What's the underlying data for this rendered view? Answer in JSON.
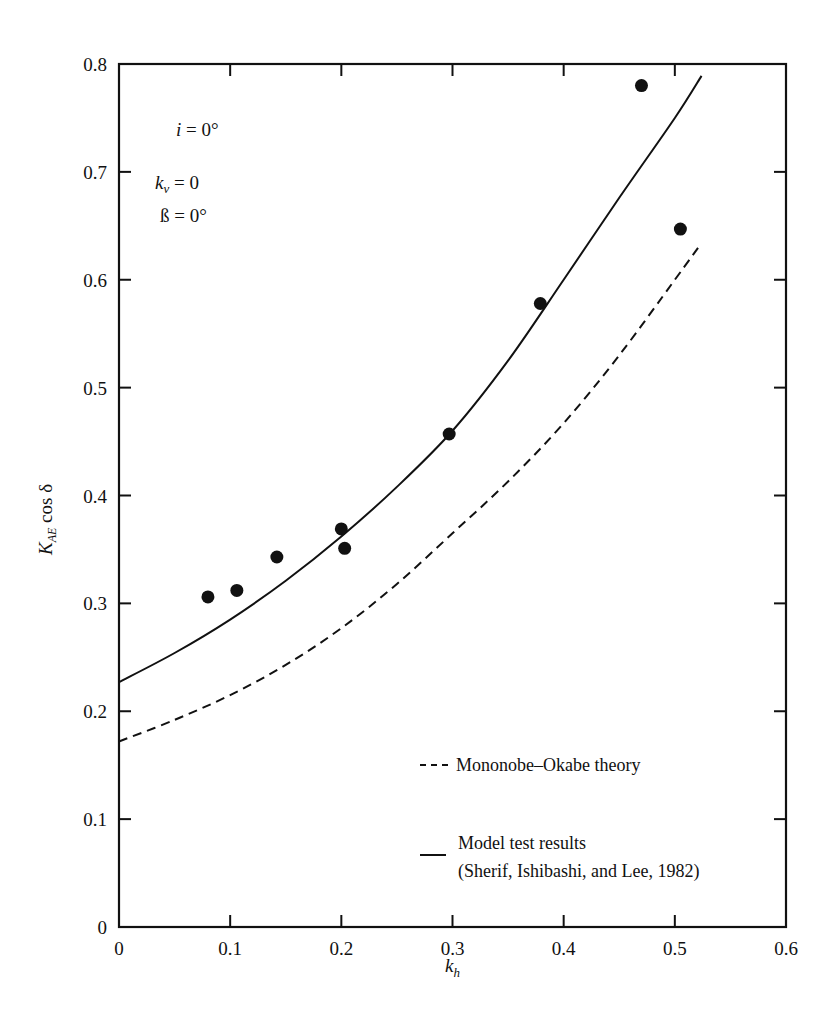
{
  "chart_data": {
    "type": "scatter",
    "title": "",
    "xlabel": "k_h",
    "ylabel": "K_AE cos δ",
    "xlim": [
      0,
      0.6
    ],
    "ylim": [
      0,
      0.8
    ],
    "x_ticks": [
      "0",
      "0.1",
      "0.2",
      "0.3",
      "0.4",
      "0.5",
      "0.6"
    ],
    "y_ticks": [
      "0",
      "0.1",
      "0.2",
      "0.3",
      "0.4",
      "0.5",
      "0.6",
      "0.7",
      "0.8"
    ],
    "grid": false,
    "legend_position": "lower right",
    "annotations": [
      "i = 0°",
      "k_v = 0",
      "β = 0°"
    ],
    "series": [
      {
        "name": "Data points",
        "style": "filled-circle",
        "points": [
          [
            0.08,
            0.306
          ],
          [
            0.106,
            0.312
          ],
          [
            0.142,
            0.343
          ],
          [
            0.2,
            0.369
          ],
          [
            0.203,
            0.351
          ],
          [
            0.297,
            0.457
          ],
          [
            0.379,
            0.578
          ],
          [
            0.47,
            0.78
          ],
          [
            0.505,
            0.647
          ]
        ]
      },
      {
        "name": "Model test results (Sherif, Ishibashi, and Lee, 1982)",
        "style": "solid",
        "points": [
          [
            0,
            0.227
          ],
          [
            0.05,
            0.254
          ],
          [
            0.1,
            0.285
          ],
          [
            0.15,
            0.321
          ],
          [
            0.2,
            0.362
          ],
          [
            0.25,
            0.408
          ],
          [
            0.3,
            0.46
          ],
          [
            0.35,
            0.525
          ],
          [
            0.4,
            0.6
          ],
          [
            0.45,
            0.676
          ],
          [
            0.5,
            0.75
          ],
          [
            0.524,
            0.789
          ]
        ]
      },
      {
        "name": "Mononobe-Okabe theory",
        "style": "dashed",
        "points": [
          [
            0,
            0.172
          ],
          [
            0.05,
            0.192
          ],
          [
            0.1,
            0.215
          ],
          [
            0.15,
            0.243
          ],
          [
            0.2,
            0.277
          ],
          [
            0.25,
            0.318
          ],
          [
            0.3,
            0.365
          ],
          [
            0.35,
            0.413
          ],
          [
            0.4,
            0.467
          ],
          [
            0.45,
            0.53
          ],
          [
            0.5,
            0.6
          ],
          [
            0.524,
            0.634
          ]
        ]
      }
    ]
  },
  "annotations": {
    "i_label": "i",
    "i_value": " = 0°",
    "kv_label": "k",
    "kv_sub": "v",
    "kv_value": " = 0",
    "beta_label": "ß",
    "beta_value": " = 0°"
  },
  "axes": {
    "xlabel_main": "k",
    "xlabel_sub": "h",
    "ylabel_main": "K",
    "ylabel_sub": "AE",
    "ylabel_rest": " cos δ"
  },
  "legend": {
    "dashed_label": "Mononobe–Okabe theory",
    "solid_label_line1": "Model test results",
    "solid_label_line2": "(Sherif, Ishibashi, and Lee, 1982)"
  }
}
